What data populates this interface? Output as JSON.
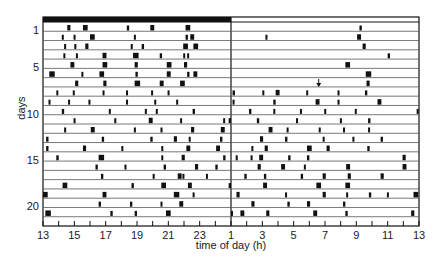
{
  "chart_data": {
    "type": "actogram",
    "title": "",
    "xlabel": "time of day (h)",
    "ylabel": "days",
    "x_ticks": [
      "13",
      "15",
      "17",
      "19",
      "21",
      "23",
      "1",
      "3",
      "5",
      "7",
      "9",
      "11",
      "13"
    ],
    "x_range_hours": [
      13,
      37
    ],
    "y_ticks": [
      {
        "day": 1,
        "label": "1"
      },
      {
        "day": 5,
        "label": "5"
      },
      {
        "day": 10,
        "label": "10"
      },
      {
        "day": 15,
        "label": "15"
      },
      {
        "day": 20,
        "label": "20"
      }
    ],
    "num_rows": 22,
    "grid": "horizontal row lines",
    "top_bar": {
      "from_hour": 13,
      "to_hour": 25,
      "color": "#111111",
      "label": "light period indicator"
    },
    "midline_hour": 25,
    "annotation": {
      "type": "arrow",
      "row": 7,
      "hour": 30.6
    },
    "colors": {
      "ink": "#111111",
      "line": "#555555",
      "background": "#ffffff"
    },
    "rows": [
      {
        "day": 1,
        "events": [
          [
            14.55,
            0.2
          ],
          [
            15.55,
            0.3
          ],
          [
            18.35,
            0.15
          ],
          [
            19.85,
            0.25
          ],
          [
            22.1,
            0.3
          ],
          [
            33.2,
            0.15
          ]
        ]
      },
      {
        "day": 2,
        "events": [
          [
            14.2,
            0.1
          ],
          [
            14.95,
            0.12
          ],
          [
            16.0,
            0.3
          ],
          [
            18.8,
            0.1
          ],
          [
            22.1,
            0.15
          ],
          [
            22.4,
            0.25
          ],
          [
            27.2,
            0.1
          ],
          [
            33.05,
            0.25
          ]
        ]
      },
      {
        "day": 3,
        "events": [
          [
            14.35,
            0.1
          ],
          [
            15.0,
            0.12
          ],
          [
            15.7,
            0.2
          ],
          [
            18.6,
            0.1
          ],
          [
            19.3,
            0.15
          ],
          [
            21.95,
            0.3
          ],
          [
            22.6,
            0.3
          ],
          [
            33.4,
            0.2
          ]
        ]
      },
      {
        "day": 4,
        "events": [
          [
            14.3,
            0.1
          ],
          [
            15.1,
            0.12
          ],
          [
            16.8,
            0.25
          ],
          [
            18.75,
            0.35
          ],
          [
            20.45,
            0.15
          ],
          [
            21.95,
            0.12
          ],
          [
            22.2,
            0.12
          ],
          [
            35.0,
            0.15
          ]
        ]
      },
      {
        "day": 5,
        "events": [
          [
            14.75,
            0.25
          ],
          [
            16.8,
            0.3
          ],
          [
            18.85,
            0.2
          ],
          [
            20.9,
            0.3
          ],
          [
            22.0,
            0.2
          ],
          [
            32.3,
            0.3
          ]
        ]
      },
      {
        "day": 6,
        "events": [
          [
            13.4,
            0.35
          ],
          [
            15.45,
            0.08
          ],
          [
            16.6,
            0.3
          ],
          [
            18.9,
            0.15
          ],
          [
            20.9,
            0.25
          ],
          [
            22.2,
            0.15
          ],
          [
            22.6,
            0.25
          ],
          [
            33.6,
            0.35
          ]
        ]
      },
      {
        "day": 7,
        "events": [
          [
            15.05,
            0.2
          ],
          [
            16.85,
            0.2
          ],
          [
            18.85,
            0.35
          ],
          [
            20.45,
            0.25
          ],
          [
            21.75,
            0.3
          ],
          [
            33.65,
            0.2
          ]
        ]
      },
      {
        "day": 8,
        "events": [
          [
            13.85,
            0.12
          ],
          [
            14.9,
            0.12
          ],
          [
            16.8,
            0.12
          ],
          [
            18.3,
            0.12
          ],
          [
            19.9,
            0.12
          ],
          [
            20.95,
            0.12
          ],
          [
            25.1,
            0.15
          ],
          [
            27.0,
            0.12
          ],
          [
            27.85,
            0.25
          ],
          [
            29.8,
            0.12
          ],
          [
            31.8,
            0.12
          ],
          [
            33.55,
            0.15
          ]
        ]
      },
      {
        "day": 9,
        "events": [
          [
            13.35,
            0.08
          ],
          [
            14.6,
            0.12
          ],
          [
            15.9,
            0.12
          ],
          [
            18.3,
            0.1
          ],
          [
            20.1,
            0.12
          ],
          [
            21.5,
            0.12
          ],
          [
            25.1,
            0.12
          ],
          [
            27.7,
            0.15
          ],
          [
            30.4,
            0.25
          ],
          [
            31.8,
            0.12
          ],
          [
            34.35,
            0.25
          ]
        ]
      },
      {
        "day": 10,
        "events": [
          [
            14.2,
            0.15
          ],
          [
            17.2,
            0.12
          ],
          [
            19.5,
            0.12
          ],
          [
            20.2,
            0.12
          ],
          [
            22.55,
            0.15
          ],
          [
            26.15,
            0.15
          ],
          [
            27.7,
            0.12
          ],
          [
            29.4,
            0.12
          ],
          [
            30.95,
            0.12
          ],
          [
            32.9,
            0.12
          ],
          [
            36.85,
            0.08
          ]
        ]
      },
      {
        "day": 11,
        "events": [
          [
            14.95,
            0.12
          ],
          [
            17.55,
            0.12
          ],
          [
            19.75,
            0.25
          ],
          [
            21.75,
            0.12
          ],
          [
            24.5,
            0.08
          ],
          [
            24.85,
            0.15
          ],
          [
            26.65,
            0.15
          ],
          [
            29.15,
            0.1
          ],
          [
            31.95,
            0.12
          ],
          [
            33.75,
            0.15
          ]
        ]
      },
      {
        "day": 12,
        "events": [
          [
            14.35,
            0.12
          ],
          [
            16.05,
            0.25
          ],
          [
            18.8,
            0.12
          ],
          [
            20.5,
            0.12
          ],
          [
            22.45,
            0.2
          ],
          [
            24.35,
            0.25
          ],
          [
            27.4,
            0.25
          ],
          [
            28.55,
            0.12
          ],
          [
            30.6,
            0.12
          ],
          [
            32.15,
            0.12
          ],
          [
            33.75,
            0.12
          ]
        ]
      },
      {
        "day": 13,
        "events": [
          [
            13.2,
            0.15
          ],
          [
            16.75,
            0.15
          ],
          [
            19.85,
            0.15
          ],
          [
            21.35,
            0.2
          ],
          [
            22.3,
            0.12
          ],
          [
            24.3,
            0.15
          ],
          [
            26.85,
            0.2
          ],
          [
            28.45,
            0.15
          ],
          [
            30.85,
            0.12
          ],
          [
            32.75,
            0.12
          ],
          [
            34.55,
            0.15
          ]
        ]
      },
      {
        "day": 14,
        "events": [
          [
            13.2,
            0.15
          ],
          [
            15.55,
            0.2
          ],
          [
            18.0,
            0.1
          ],
          [
            20.55,
            0.12
          ],
          [
            22.15,
            0.25
          ],
          [
            24.05,
            0.25
          ],
          [
            26.3,
            0.12
          ],
          [
            27.15,
            0.2
          ],
          [
            29.85,
            0.3
          ],
          [
            31.1,
            0.2
          ],
          [
            33.7,
            0.15
          ]
        ]
      },
      {
        "day": 15,
        "events": [
          [
            13.85,
            0.15
          ],
          [
            16.55,
            0.35
          ],
          [
            20.55,
            0.1
          ],
          [
            21.85,
            0.2
          ],
          [
            24.5,
            0.15
          ],
          [
            25.3,
            0.08
          ],
          [
            26.25,
            0.1
          ],
          [
            26.8,
            0.25
          ],
          [
            28.65,
            0.15
          ],
          [
            29.85,
            0.15
          ],
          [
            35.95,
            0.2
          ]
        ]
      },
      {
        "day": 16,
        "events": [
          [
            16.35,
            0.15
          ],
          [
            18.2,
            0.12
          ],
          [
            20.7,
            0.15
          ],
          [
            22.7,
            0.2
          ],
          [
            24.0,
            0.15
          ],
          [
            26.7,
            0.2
          ],
          [
            28.2,
            0.25
          ],
          [
            29.65,
            0.12
          ],
          [
            32.35,
            0.25
          ],
          [
            35.95,
            0.25
          ]
        ]
      },
      {
        "day": 17,
        "events": [
          [
            16.7,
            0.15
          ],
          [
            20.0,
            0.12
          ],
          [
            21.6,
            0.25
          ],
          [
            21.9,
            0.08
          ],
          [
            23.4,
            0.12
          ],
          [
            25.85,
            0.15
          ],
          [
            27.1,
            0.15
          ],
          [
            29.45,
            0.15
          ],
          [
            30.85,
            0.2
          ],
          [
            32.45,
            0.2
          ],
          [
            34.55,
            0.2
          ]
        ]
      },
      {
        "day": 18,
        "events": [
          [
            14.25,
            0.3
          ],
          [
            18.65,
            0.15
          ],
          [
            20.55,
            0.3
          ],
          [
            22.25,
            0.25
          ],
          [
            24.85,
            0.15
          ],
          [
            27.05,
            0.25
          ],
          [
            30.45,
            0.3
          ],
          [
            32.3,
            0.3
          ]
        ]
      },
      {
        "day": 19,
        "events": [
          [
            13.0,
            0.3
          ],
          [
            16.8,
            0.25
          ],
          [
            21.35,
            0.35
          ],
          [
            22.55,
            0.12
          ],
          [
            25.35,
            0.2
          ],
          [
            28.45,
            0.08
          ],
          [
            30.85,
            0.2
          ],
          [
            32.35,
            0.12
          ],
          [
            33.8,
            0.15
          ],
          [
            34.95,
            0.12
          ],
          [
            36.65,
            0.3
          ]
        ]
      },
      {
        "day": 20,
        "events": [
          [
            16.55,
            0.15
          ],
          [
            18.55,
            0.15
          ],
          [
            20.5,
            0.1
          ],
          [
            21.7,
            0.25
          ],
          [
            26.3,
            0.2
          ],
          [
            28.6,
            0.15
          ],
          [
            29.85,
            0.2
          ],
          [
            32.15,
            0.15
          ]
        ]
      },
      {
        "day": 21,
        "events": [
          [
            13.15,
            0.35
          ],
          [
            17.3,
            0.15
          ],
          [
            18.85,
            0.15
          ],
          [
            20.85,
            0.3
          ],
          [
            25.0,
            0.08
          ],
          [
            25.6,
            0.25
          ],
          [
            27.25,
            0.2
          ],
          [
            30.25,
            0.25
          ],
          [
            32.3,
            0.15
          ],
          [
            36.5,
            0.2
          ]
        ]
      },
      {
        "day": 22,
        "events": []
      }
    ]
  }
}
